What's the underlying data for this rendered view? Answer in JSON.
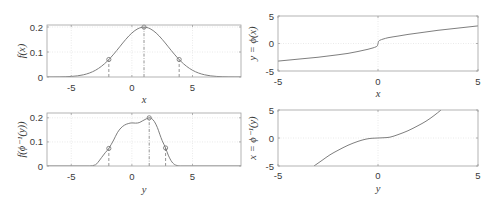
{
  "figure": {
    "width": 493,
    "height": 203
  },
  "colors": {
    "line": "#6f6f6f",
    "marker": "#6f6f6f",
    "guide": "#7a7a7a",
    "axes": "#a0a0a0",
    "grid": "#e4e4e4",
    "text": "#3a3a3a",
    "background": "#ffffff"
  },
  "chart_data": [
    {
      "id": "pdf-x",
      "type": "line",
      "title": "",
      "xlabel": "x",
      "ylabel": "f(x)",
      "xlim": [
        -7,
        9
      ],
      "ylim": [
        0,
        0.208
      ],
      "xticks": [
        -5,
        0,
        5
      ],
      "xticklabels": [
        "-5",
        "0",
        "5"
      ],
      "yticks": [
        0,
        0.1,
        0.2
      ],
      "yticklabels": [
        "0",
        "0.1",
        "0.2"
      ],
      "grid": true,
      "series": [
        {
          "name": "f(x)",
          "x": [
            -7,
            -6.5,
            -6,
            -5.5,
            -5,
            -4.5,
            -4,
            -3.5,
            -3,
            -2.5,
            -2,
            -1.5,
            -1,
            -0.5,
            0,
            0.5,
            1,
            1.5,
            2,
            2.5,
            3,
            3.5,
            4,
            4.5,
            5,
            5.5,
            6,
            6.5,
            7,
            7.5,
            8,
            8.5,
            9
          ],
          "y": [
            0.0001,
            0.0002,
            0.0004,
            0.001,
            0.0022,
            0.0045,
            0.0088,
            0.0159,
            0.027,
            0.0431,
            0.0648,
            0.0913,
            0.121,
            0.1506,
            0.176,
            0.1933,
            0.1995,
            0.1933,
            0.176,
            0.1506,
            0.121,
            0.0913,
            0.0648,
            0.0431,
            0.027,
            0.0159,
            0.0088,
            0.0045,
            0.0022,
            0.001,
            0.0004,
            0.0002,
            0.0001
          ]
        }
      ],
      "markers": [
        {
          "x": -1.9,
          "y": 0.07
        },
        {
          "x": 1.0,
          "y": 0.1995
        },
        {
          "x": 3.9,
          "y": 0.07
        }
      ],
      "guides": [
        {
          "x": -1.9,
          "y": 0.07,
          "style": "dashed"
        },
        {
          "x": 1.0,
          "y": 0.1995,
          "style": "dashdot"
        },
        {
          "x": 3.9,
          "y": 0.07,
          "style": "dashed"
        }
      ]
    },
    {
      "id": "pdf-phi-inverse-y",
      "type": "line",
      "title": "",
      "xlabel": "y",
      "ylabel": "f(ϕ⁻¹(y))",
      "xlim": [
        -7,
        9
      ],
      "ylim": [
        0,
        0.22
      ],
      "xticks": [
        -5,
        0,
        5
      ],
      "xticklabels": [
        "-5",
        "0",
        "5"
      ],
      "yticks": [
        0,
        0.1,
        0.2
      ],
      "yticklabels": [
        "0",
        "0.1",
        "0.2"
      ],
      "grid": true,
      "series": [
        {
          "name": "f(ϕ⁻¹(y))",
          "x": [
            -7,
            -3.5,
            -3,
            -2.8,
            -2.5,
            -2.2,
            -1.9,
            -1.5,
            -1.2,
            -0.9,
            -0.6,
            -0.3,
            0,
            0.3,
            0.6,
            0.9,
            1.2,
            1.43,
            1.6,
            1.85,
            2.1,
            2.3,
            2.5,
            2.78,
            3.0,
            3.3,
            3.6,
            4.0,
            9
          ],
          "y": [
            0,
            0,
            0.005,
            0.015,
            0.035,
            0.055,
            0.073,
            0.108,
            0.138,
            0.158,
            0.17,
            0.176,
            0.179,
            0.178,
            0.18,
            0.188,
            0.196,
            0.2,
            0.198,
            0.185,
            0.16,
            0.132,
            0.105,
            0.075,
            0.045,
            0.017,
            0.004,
            0,
            0
          ]
        }
      ],
      "markers": [
        {
          "x": -1.9,
          "y": 0.073
        },
        {
          "x": 1.43,
          "y": 0.2
        },
        {
          "x": 2.78,
          "y": 0.075
        }
      ],
      "guides": [
        {
          "x": -1.9,
          "y": 0.073,
          "style": "dashed"
        },
        {
          "x": 1.43,
          "y": 0.2,
          "style": "dashdot"
        },
        {
          "x": 2.78,
          "y": 0.075,
          "style": "dashed"
        }
      ]
    },
    {
      "id": "phi-x",
      "type": "line",
      "title": "",
      "xlabel": "x",
      "ylabel": "y = ϕ(x)",
      "xlim": [
        -5,
        5
      ],
      "ylim": [
        -5,
        5
      ],
      "xticks": [
        -5,
        0,
        5
      ],
      "xticklabels": [
        "-5",
        "0",
        "5"
      ],
      "yticks": [
        -5,
        0,
        5
      ],
      "yticklabels": [
        "-5",
        "0",
        "5"
      ],
      "grid": true,
      "series": [
        {
          "name": "ϕ(x)",
          "x": [
            -5,
            -4,
            -3,
            -2,
            -1.5,
            -1,
            -0.5,
            -0.25,
            -0.1,
            -0.03,
            0,
            0.03,
            0.1,
            0.25,
            0.5,
            1,
            1.5,
            2,
            3,
            4,
            5
          ],
          "y": [
            -3.2,
            -2.85,
            -2.5,
            -2.05,
            -1.8,
            -1.45,
            -1.05,
            -0.8,
            -0.6,
            -0.4,
            0,
            0.4,
            0.6,
            0.8,
            1.05,
            1.35,
            1.65,
            1.9,
            2.4,
            2.8,
            3.2
          ]
        }
      ],
      "markers": [],
      "guides": []
    },
    {
      "id": "phi-inverse-y",
      "type": "line",
      "title": "",
      "xlabel": "y",
      "ylabel": "x = ϕ⁻¹(y)",
      "xlim": [
        -5,
        5
      ],
      "ylim": [
        -5,
        5
      ],
      "xticks": [
        -5,
        0,
        5
      ],
      "xticklabels": [
        "-5",
        "0",
        "5"
      ],
      "yticks": [
        -5,
        0,
        5
      ],
      "yticklabels": [
        "-5",
        "0",
        "5"
      ],
      "grid": true,
      "series": [
        {
          "name": "ϕ⁻¹(y)",
          "x": [
            -3.2,
            -2.8,
            -2.4,
            -2.0,
            -1.5,
            -1.0,
            -0.6,
            -0.3,
            0,
            0.3,
            0.6,
            1.0,
            1.5,
            2.0,
            2.4,
            2.8,
            3.15
          ],
          "y": [
            -5,
            -4.0,
            -3.0,
            -2.2,
            -1.3,
            -0.6,
            -0.2,
            -0.05,
            0,
            0.05,
            0.15,
            0.6,
            1.3,
            2.2,
            3.0,
            4.0,
            5
          ]
        }
      ],
      "markers": [],
      "guides": []
    }
  ]
}
